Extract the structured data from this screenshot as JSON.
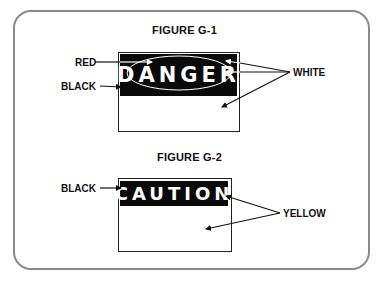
{
  "figures": [
    {
      "title": "FIGURE G-1",
      "sign_text": "DANGER",
      "labels": {
        "red": "RED",
        "black": "BLACK",
        "white": "WHITE"
      }
    },
    {
      "title": "FIGURE G-2",
      "sign_text": "CAUTION",
      "labels": {
        "black": "BLACK",
        "yellow": "YELLOW"
      }
    }
  ],
  "colors": {
    "frame": "#8a8a8a",
    "band": "#0a0a0a",
    "text": "#111111"
  }
}
